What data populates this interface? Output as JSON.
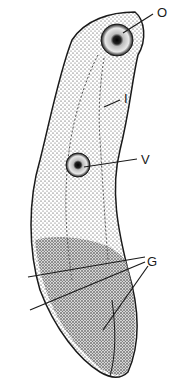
{
  "figure": {
    "colors": {
      "ink": "#1a1a1a",
      "background": "#ffffff"
    },
    "labels": [
      {
        "key": "oral_sucker",
        "text": "O",
        "x": 157,
        "y": 6
      },
      {
        "key": "intestine",
        "text": "I",
        "x": 124,
        "y": 92
      },
      {
        "key": "ventral_sucker",
        "text": "V",
        "x": 141,
        "y": 153
      },
      {
        "key": "genital",
        "text": "G",
        "x": 147,
        "y": 255
      }
    ]
  }
}
